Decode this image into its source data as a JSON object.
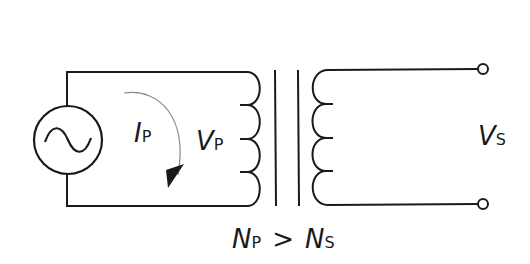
{
  "diagram": {
    "type": "step-down transformer circuit",
    "colors": {
      "line": "#1a1a1a",
      "arrow": "#8a8a8a",
      "background": "#ffffff"
    },
    "components": {
      "source": {
        "icon": "ac-source-icon",
        "glyph": "~"
      },
      "primary_coil": {
        "turns": 4
      },
      "core": {
        "lines": 2
      },
      "secondary_coil": {
        "turns": 4
      },
      "terminals": 2
    },
    "labels": {
      "current": {
        "main": "I",
        "sub": "P"
      },
      "primary_voltage": {
        "main": "V",
        "sub": "P"
      },
      "secondary_voltage": {
        "main": "V",
        "sub": "S"
      },
      "relation": {
        "left_main": "N",
        "left_sub": "P",
        "operator": ">",
        "right_main": "N",
        "right_sub": "S"
      }
    }
  }
}
